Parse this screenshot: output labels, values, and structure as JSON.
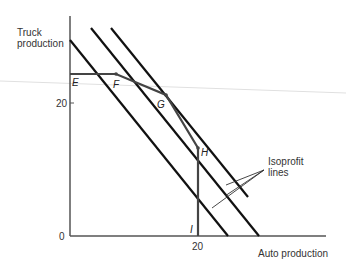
{
  "axes": {
    "y_label_line1": "Truck",
    "y_label_line2": "production",
    "x_label": "Auto production",
    "y_tick_20": "20",
    "x_tick_20": "20",
    "origin": "0"
  },
  "points": {
    "E": "E",
    "F": "F",
    "G": "G",
    "H": "H",
    "I": "I"
  },
  "annotation": {
    "line1": "Isoprofit",
    "line2": "lines"
  },
  "colors": {
    "ink": "#111111",
    "axis": "#555555",
    "frontier": "#444444",
    "artifact": "#d8d8d8"
  }
}
